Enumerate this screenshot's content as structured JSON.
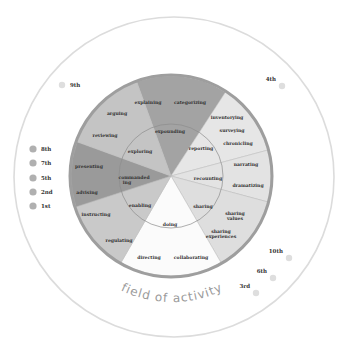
{
  "diagram": {
    "title": "field of activity",
    "colors": {
      "outer_ring": "#dcdcdc",
      "wheel_border": "#9e9e9e",
      "inner_ring_line": "#8c8c8c",
      "dot": "#b0b0b0",
      "dot_light": "#dedede"
    },
    "sectors": [
      {
        "name": "expounding",
        "color": "#a3a3a3",
        "start": -20,
        "end": 33,
        "inner_label": "expounding",
        "outer_labels": [
          "explaining",
          "categorizing"
        ]
      },
      {
        "name": "reporting",
        "color": "#e6e6e6",
        "start": 33,
        "end": 75,
        "inner_label": "reporting",
        "outer_labels": [
          "inventorying",
          "surveying",
          "chronicling"
        ]
      },
      {
        "name": "recounting",
        "color": "#e3e3e3",
        "start": 75,
        "end": 105,
        "inner_label": "recounting",
        "outer_labels": [
          "narrating",
          "dramatizing"
        ]
      },
      {
        "name": "sharing",
        "color": "#dedede",
        "start": 105,
        "end": 150,
        "inner_label": "sharing",
        "outer_labels": [
          "sharing values",
          "sharing experiences"
        ]
      },
      {
        "name": "doing",
        "color": "#fbfbfb",
        "start": 150,
        "end": 210,
        "inner_label": "doing",
        "outer_labels": [
          "directing",
          "collaborating"
        ]
      },
      {
        "name": "enabling",
        "color": "#c9c9c9",
        "start": 210,
        "end": 252,
        "inner_label": "enabling",
        "outer_labels": [
          "instructing",
          "regulating"
        ]
      },
      {
        "name": "commanding",
        "color": "#9a9a9a",
        "start": 252,
        "end": 290,
        "inner_label": "commanding",
        "outer_labels": [
          "advising",
          "presenting"
        ]
      },
      {
        "name": "exploring",
        "color": "#c4c4c4",
        "start": 290,
        "end": 340,
        "inner_label": "exploring",
        "outer_labels": [
          "arguing",
          "reviewing"
        ]
      }
    ],
    "text_labels": {
      "explaining": "explaining",
      "categorizing": "categorizing",
      "expounding": "expounding",
      "inventorying": "inventorying",
      "surveying": "surveying",
      "chronicling": "chronicling",
      "reporting": "reporting",
      "narrating": "narrating",
      "recounting": "recounting",
      "dramatizing": "dramatizing",
      "sharing": "sharing",
      "sharing_values_1": "sharing",
      "sharing_values_2": "values",
      "sharing_exp_1": "sharing",
      "sharing_exp_2": "experiences",
      "doing": "doing",
      "directing": "directing",
      "collaborating": "collaborating",
      "enabling": "enabling",
      "instructing": "instructing",
      "regulating": "regulating",
      "commanding_1": "commanded",
      "commanding_2": "ing",
      "advising": "advising",
      "presenting": "presenting",
      "exploring": "exploring",
      "arguing": "arguing",
      "reviewing": "reviewing"
    },
    "ordinal_markers": [
      {
        "label": "9th",
        "x": 62,
        "y": 85,
        "tone": "light"
      },
      {
        "label": "8th",
        "x": 33,
        "y": 149,
        "tone": "dark"
      },
      {
        "label": "7th",
        "x": 33,
        "y": 163,
        "tone": "dark"
      },
      {
        "label": "5th",
        "x": 33,
        "y": 178,
        "tone": "dark"
      },
      {
        "label": "2nd",
        "x": 33,
        "y": 192,
        "tone": "dark"
      },
      {
        "label": "1st",
        "x": 33,
        "y": 206,
        "tone": "dark"
      },
      {
        "label": "4th",
        "x": 282,
        "y": 86,
        "tone": "light",
        "label_left": true
      },
      {
        "label": "10th",
        "x": 289,
        "y": 258,
        "tone": "light",
        "label_left": true
      },
      {
        "label": "6th",
        "x": 273,
        "y": 278,
        "tone": "light",
        "label_left": true
      },
      {
        "label": "3rd",
        "x": 256,
        "y": 293,
        "tone": "light",
        "label_left": true
      }
    ]
  }
}
